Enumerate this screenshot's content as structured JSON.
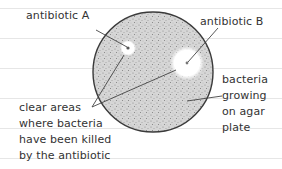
{
  "diagram": {
    "title": "",
    "labels": {
      "antibiotic_a": "antibiotic A",
      "antibiotic_b": "antibiotic B",
      "bacteria": [
        "bacteria",
        "growing",
        "on agar",
        "plate"
      ],
      "clear_areas": [
        "clear areas",
        "where bacteria",
        "have been killed",
        "by the antibiotic"
      ]
    },
    "colors": {
      "plate_fill": "#cfcfcf",
      "plate_outline": "#3a3a3a",
      "clear_zone": "#ffffff",
      "leader_line": "#444444",
      "text": "#333333",
      "rule_lines": "#e6e6e6"
    },
    "nodes": [
      {
        "id": "agar-plate",
        "shape": "circle",
        "label": "bacteria growing on agar plate"
      },
      {
        "id": "clear-zone-a",
        "shape": "circle",
        "label": "antibiotic A"
      },
      {
        "id": "clear-zone-b",
        "shape": "circle",
        "label": "antibiotic B"
      }
    ]
  }
}
